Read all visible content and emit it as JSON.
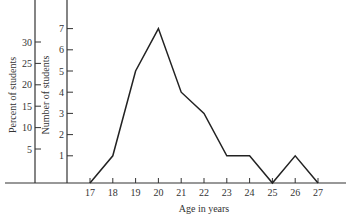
{
  "chart_data": {
    "type": "line",
    "title": "",
    "xlabel": "Age in years",
    "ylabel": "Number of students",
    "ylabel_secondary": "Percent of students",
    "categories": [
      "17",
      "18",
      "19",
      "20",
      "21",
      "22",
      "23",
      "24",
      "25",
      "26",
      "27"
    ],
    "x": [
      17,
      18,
      19,
      20,
      21,
      22,
      23,
      24,
      25,
      26,
      27
    ],
    "values": [
      0,
      1,
      5,
      7,
      4,
      3,
      1,
      1,
      0,
      1,
      0
    ],
    "series": [
      {
        "name": "Number of students",
        "values": [
          0,
          1,
          5,
          7,
          4,
          3,
          1,
          1,
          0,
          1,
          0
        ]
      }
    ],
    "y_ticks": [
      "1",
      "2",
      "3",
      "4",
      "5",
      "6",
      "7"
    ],
    "y2_ticks": [
      "5",
      "10",
      "15",
      "20",
      "25",
      "30"
    ],
    "ylim": [
      0,
      8
    ],
    "y2lim": [
      0,
      35
    ],
    "grid": false,
    "legend": "none"
  },
  "colors": {
    "line": "#222222",
    "axis": "#333333",
    "background": "#ffffff"
  }
}
